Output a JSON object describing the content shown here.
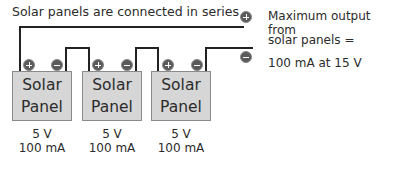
{
  "title": "Solar panels are connected in series",
  "output_text": {
    "line1": "Maximum output from",
    "line2": "solar panels =",
    "line3": "100 mA at 15 V"
  },
  "panels": [
    {
      "label_line1": "Solar",
      "label_line2": "Panel",
      "voltage": "5 V",
      "current": "100 mA"
    },
    {
      "label_line1": "Solar",
      "label_line2": "Panel",
      "voltage": "5 V",
      "current": "100 mA"
    },
    {
      "label_line1": "Solar",
      "label_line2": "Panel",
      "voltage": "5 V",
      "current": "100 mA"
    }
  ],
  "colors": {
    "panel_fill": "#d6d6d6",
    "wire": "#222222",
    "terminal": "#5a5a5a"
  },
  "terminals": {
    "plus_icon": "plus-circle-icon",
    "minus_icon": "minus-circle-icon"
  }
}
